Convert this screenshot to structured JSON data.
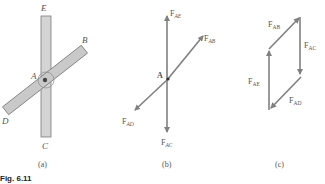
{
  "figure": {
    "caption": "Fig. 6.11",
    "panels": [
      {
        "id": "a",
        "label": "(a)",
        "points": {
          "E": "E",
          "B": "B",
          "A": "A",
          "D": "D",
          "C": "C"
        }
      },
      {
        "id": "b",
        "label": "(b)",
        "point": "A",
        "forces": {
          "AE": "AE",
          "AB": "AB",
          "AD": "AD",
          "AC": "AC"
        },
        "force_prefix": "F"
      },
      {
        "id": "c",
        "label": "(c)",
        "forces": {
          "AB": "AB",
          "AC": "AC",
          "AE": "AE",
          "AD": "AD"
        },
        "force_prefix": "F"
      }
    ],
    "colors": {
      "member_fill": "#cfcfcf",
      "member_stroke": "#7a7a7a",
      "arrow": "#808080",
      "text": "#555555"
    }
  }
}
